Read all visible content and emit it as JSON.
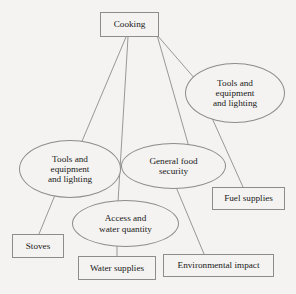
{
  "diagram": {
    "style": {
      "background": "#f4f3f1",
      "stroke": "#8c8c8c",
      "text": "#1a1a1a"
    },
    "nodes": [
      {
        "id": "cooking",
        "label": "Cooking",
        "shape": "box",
        "x": 100,
        "y": 12,
        "w": 59,
        "h": 25
      },
      {
        "id": "tools_right",
        "label": "Tools and\nequipment\nand lighting",
        "shape": "ellipse",
        "x": 185,
        "y": 63,
        "w": 100,
        "h": 60
      },
      {
        "id": "tools_left",
        "label": "Tools and\nequipment\nand lighting",
        "shape": "ellipse",
        "x": 19,
        "y": 140,
        "w": 102,
        "h": 58
      },
      {
        "id": "food_sec",
        "label": "General food\nsecurity",
        "shape": "ellipse",
        "x": 121,
        "y": 143,
        "w": 105,
        "h": 46
      },
      {
        "id": "access_water",
        "label": "Access and\nwater quantity",
        "shape": "ellipse",
        "x": 72,
        "y": 200,
        "w": 107,
        "h": 47
      },
      {
        "id": "fuel",
        "label": "Fuel supplies",
        "shape": "box",
        "x": 212,
        "y": 187,
        "w": 73,
        "h": 23
      },
      {
        "id": "stoves",
        "label": "Stoves",
        "shape": "box",
        "x": 12,
        "y": 234,
        "w": 52,
        "h": 24
      },
      {
        "id": "water_sup",
        "label": "Water supplies",
        "shape": "box",
        "x": 78,
        "y": 256,
        "w": 78,
        "h": 24
      },
      {
        "id": "env_impact",
        "label": "Environmental impact",
        "shape": "box",
        "x": 163,
        "y": 254,
        "w": 111,
        "h": 23
      }
    ],
    "edges": [
      {
        "from": "cooking",
        "to": "tools_left",
        "x1": 126,
        "y1": 37,
        "x2": 80,
        "y2": 146
      },
      {
        "from": "cooking",
        "to": "access_water",
        "x1": 128,
        "y1": 37,
        "x2": 118,
        "y2": 202
      },
      {
        "from": "cooking",
        "to": "tools_right",
        "x1": 157,
        "y1": 35,
        "x2": 196,
        "y2": 80
      },
      {
        "from": "cooking",
        "to": "food_sec",
        "x1": 157,
        "y1": 35,
        "x2": 189,
        "y2": 147
      },
      {
        "from": "tools_right",
        "to": "fuel",
        "x1": 212,
        "y1": 118,
        "x2": 243,
        "y2": 187
      },
      {
        "from": "tools_left",
        "to": "stoves",
        "x1": 55,
        "y1": 195,
        "x2": 39,
        "y2": 234
      },
      {
        "from": "access_water",
        "to": "water_sup",
        "x1": 117,
        "y1": 246,
        "x2": 117,
        "y2": 256
      },
      {
        "from": "food_sec",
        "to": "env_impact",
        "x1": 176,
        "y1": 187,
        "x2": 204,
        "y2": 254
      }
    ]
  }
}
